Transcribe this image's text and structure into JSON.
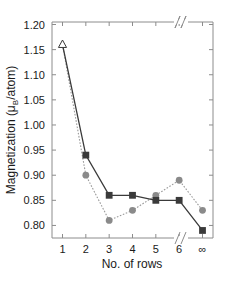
{
  "chart_data": {
    "type": "line",
    "title": "",
    "subtitle": "",
    "xlabel": "No. of rows",
    "ylabel": "Magnetization  (μB/atom)",
    "ylabel_main": "Magnetization  (",
    "ylabel_mu": "μ",
    "ylabel_sub": "B",
    "ylabel_tail": "/atom)",
    "categories": [
      "1",
      "2",
      "3",
      "4",
      "5",
      "6",
      "∞"
    ],
    "x": [
      1,
      2,
      3,
      4,
      5,
      6,
      7
    ],
    "xtick_labels": [
      "1",
      "2",
      "3",
      "4",
      "5",
      "6",
      "∞"
    ],
    "ytick_labels": [
      "0.80",
      "0.85",
      "0.90",
      "0.95",
      "1.00",
      "1.05",
      "1.10",
      "1.15",
      "1.20"
    ],
    "ytick_values": [
      0.8,
      0.85,
      0.9,
      0.95,
      1.0,
      1.05,
      1.1,
      1.15,
      1.2
    ],
    "ylim": [
      0.775,
      1.205
    ],
    "xlim": [
      0.55,
      7.45
    ],
    "grid": false,
    "legend": null,
    "axis_break_symbol": "//",
    "axis_break_x": 6.5,
    "series": [
      {
        "name": "series-squares-solid",
        "marker": "square",
        "linestyle": "solid",
        "color": "#3a3a3a",
        "values": [
          1.16,
          0.94,
          0.86,
          0.86,
          0.85,
          0.85,
          0.79
        ],
        "first_point_marker": "open-triangle"
      },
      {
        "name": "series-circles-dotted",
        "marker": "circle",
        "linestyle": "dotted",
        "color": "#8a8a8a",
        "values": [
          1.16,
          0.9,
          0.81,
          0.83,
          0.86,
          0.89,
          0.83
        ],
        "first_point_marker": "open-triangle"
      }
    ],
    "annotations": [
      {
        "name": "open-triangle-start",
        "x": 1,
        "y": 1.16,
        "marker": "open-triangle"
      }
    ]
  }
}
